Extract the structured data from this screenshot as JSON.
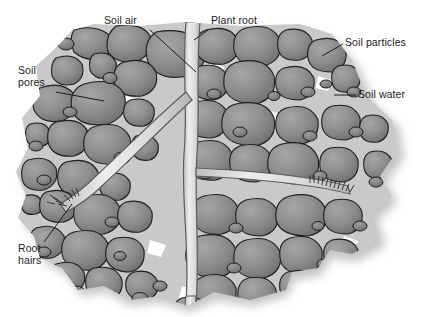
{
  "diagram": {
    "title_text": "",
    "type": "soil-profile-cross-section",
    "palette": {
      "background": "#ffffff",
      "particle_fill": "#8d8d8d",
      "particle_fill_dark": "#747474",
      "particle_fill_light": "#a2a2a2",
      "particle_outline": "#1e1e1e",
      "soil_water_film": "#c9c9c9",
      "soil_air_pore": "#ffffff",
      "root_fill": "#e4e4e4",
      "root_outline": "#5d5d5d",
      "shadow": "#bdbdbd",
      "label_text": "#1b1b1b",
      "leader_line": "#1b1b1b"
    },
    "labels": [
      {
        "name": "soil-air",
        "lines": [
          "Soil air"
        ],
        "x": 104,
        "y": 16,
        "align": "left"
      },
      {
        "name": "plant-root",
        "lines": [
          "Plant root"
        ],
        "x": 211,
        "y": 16,
        "align": "left"
      },
      {
        "name": "soil-particles",
        "lines": [
          "Soil particles"
        ],
        "x": 345,
        "y": 38,
        "align": "left"
      },
      {
        "name": "soil-water",
        "lines": [
          "Soil water"
        ],
        "x": 358,
        "y": 90,
        "align": "left"
      },
      {
        "name": "soil-pores",
        "lines": [
          "Soil",
          "pores"
        ],
        "x": 18,
        "y": 66,
        "align": "left"
      },
      {
        "name": "root-hairs",
        "lines": [
          "Root",
          "hairs"
        ],
        "x": 18,
        "y": 244,
        "align": "left"
      }
    ],
    "leaders": [
      {
        "name": "leader-soil-air",
        "points": "150,30 196,72"
      },
      {
        "name": "leader-plant-root",
        "points": "208,30 194,40"
      },
      {
        "name": "leader-soil-particles",
        "points": "343,44 322,56"
      },
      {
        "name": "leader-soil-water",
        "points": "356,95 334,95"
      },
      {
        "name": "leader-soil-pores",
        "points": "56,92 104,101"
      },
      {
        "name": "leader-root-hairs",
        "points": "44,242 72,204"
      }
    ],
    "features": [
      {
        "name": "main-root",
        "orientation": "vertical",
        "note": "light band from top to bottom centre"
      },
      {
        "name": "lateral-root-upper-left",
        "note": "branch descending to lower-left root tip"
      },
      {
        "name": "lateral-root-middle-right",
        "note": "branch running to right root tip"
      },
      {
        "name": "root-hair-cluster-left",
        "count": 9
      },
      {
        "name": "root-hair-cluster-right",
        "count": 11
      }
    ]
  }
}
